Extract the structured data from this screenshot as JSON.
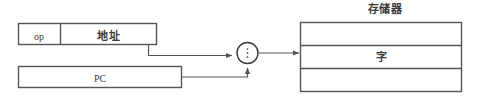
{
  "diagram": {
    "type": "block-diagram",
    "title": "",
    "background_color": "#ffffff",
    "line_color": "#555555",
    "text_color": "#3a3a3a",
    "blocks": {
      "instruction_register": {
        "op_field": "op",
        "address_field": "地址"
      },
      "program_counter": {
        "label": "PC"
      },
      "selector": {
        "label": "",
        "glyph": "vertical-ellipsis"
      },
      "memory": {
        "title": "存储器",
        "rows": [
          "",
          "字",
          ""
        ],
        "word_label": "字"
      }
    },
    "connections": [
      {
        "from": "address_field",
        "to": "selector",
        "arrow": true,
        "style": "elbow-down-right"
      },
      {
        "from": "program_counter",
        "to": "selector",
        "arrow": true,
        "style": "elbow-right-up"
      },
      {
        "from": "selector",
        "to": "memory",
        "arrow": true,
        "style": "straight-right"
      }
    ]
  }
}
